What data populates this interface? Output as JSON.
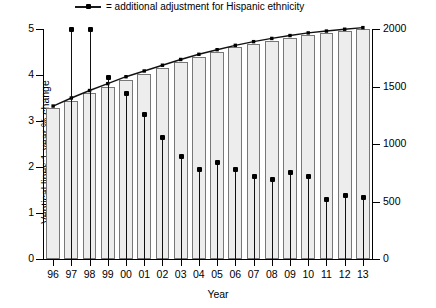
{
  "legend": {
    "marker": "line-with-dot-marker",
    "text": "= additional adjustment for Hispanic ethnicity"
  },
  "axes": {
    "x_title": "Year",
    "y_left_title": "Ventical lines:1-year % change",
    "y_right_title": "Bars:Prevalence per million population",
    "y_left_ticks": [
      "0",
      "1",
      "2",
      "3",
      "4",
      "5"
    ],
    "y_right_ticks": [
      "0",
      "500",
      "1000",
      "1500",
      "2000"
    ]
  },
  "chart_data": {
    "type": "bar",
    "title": "",
    "subtitle": "",
    "xlabel": "Year",
    "ylabel": "Ventical lines:1-year % change",
    "y2label": "Bars:Prevalence per million population",
    "ylim": [
      0,
      5
    ],
    "y2lim": [
      0,
      2000
    ],
    "grid": false,
    "legend_position": "top",
    "categories": [
      "96",
      "97",
      "98",
      "99",
      "00",
      "01",
      "02",
      "03",
      "04",
      "05",
      "06",
      "07",
      "08",
      "09",
      "10",
      "11",
      "12",
      "13"
    ],
    "series": [
      {
        "name": "Bars:Prevalence per million population",
        "axis": "right",
        "type": "bar",
        "values": [
          1310,
          1370,
          1440,
          1500,
          1560,
          1610,
          1660,
          1710,
          1760,
          1800,
          1840,
          1870,
          1900,
          1925,
          1950,
          1965,
          1985,
          2000
        ]
      },
      {
        "name": "Ventical lines:1-year % change",
        "axis": "left",
        "type": "vertical-lines-with-dots",
        "values": [
          null,
          5.0,
          5.0,
          3.95,
          3.6,
          3.15,
          2.65,
          2.25,
          1.95,
          2.1,
          1.95,
          1.8,
          1.75,
          1.9,
          1.8,
          1.3,
          1.4,
          1.35
        ]
      },
      {
        "name": "additional adjustment for Hispanic ethnicity",
        "axis": "right",
        "type": "line-with-dots",
        "values": [
          1330,
          1400,
          1465,
          1525,
          1585,
          1635,
          1685,
          1735,
          1780,
          1820,
          1858,
          1890,
          1918,
          1943,
          1966,
          1982,
          1998,
          2012
        ]
      }
    ]
  }
}
